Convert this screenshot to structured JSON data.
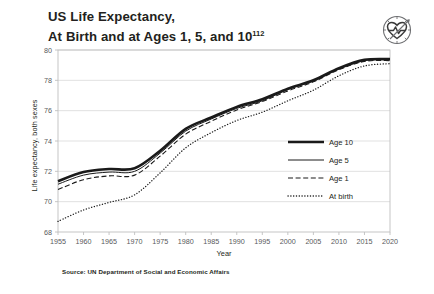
{
  "title": {
    "line1": "US Life Expectancy,",
    "line2_main": "At Birth and at Ages 1, 5, and 10",
    "line2_sup": "112"
  },
  "logo": {
    "name": "health-heart-clock-icon"
  },
  "source": {
    "text": "Source: UN Department of Social and Economic Affairs"
  },
  "chart_data": {
    "type": "line",
    "title": "US Life Expectancy, At Birth and at Ages 1, 5, and 10",
    "xlabel": "Year",
    "ylabel": "Life expectancy, both sexes",
    "xlim": [
      1955,
      2020
    ],
    "ylim": [
      68,
      80
    ],
    "xticks": [
      1955,
      1960,
      1965,
      1970,
      1975,
      1980,
      1985,
      1990,
      1995,
      2000,
      2005,
      2010,
      2015,
      2020
    ],
    "yticks": [
      68,
      70,
      72,
      74,
      76,
      78,
      80
    ],
    "grid": true,
    "legend_position": "center-right",
    "x": [
      1955,
      1960,
      1965,
      1970,
      1975,
      1980,
      1985,
      1990,
      1995,
      2000,
      2005,
      2010,
      2015,
      2020
    ],
    "series": [
      {
        "name": "Age 10",
        "style": "solid-thick",
        "values": [
          71.35,
          71.95,
          72.15,
          72.2,
          73.35,
          74.8,
          75.55,
          76.25,
          76.75,
          77.45,
          78.0,
          78.8,
          79.35,
          79.4
        ]
      },
      {
        "name": "Age 5",
        "style": "solid-thin",
        "values": [
          71.15,
          71.75,
          71.95,
          72.0,
          73.2,
          74.65,
          75.45,
          76.15,
          76.65,
          77.4,
          77.95,
          78.75,
          79.3,
          79.35
        ]
      },
      {
        "name": "Age 1",
        "style": "dashed",
        "values": [
          70.8,
          71.45,
          71.7,
          71.75,
          73.0,
          74.45,
          75.3,
          76.05,
          76.6,
          77.3,
          77.9,
          78.7,
          79.25,
          79.3
        ]
      },
      {
        "name": "At birth",
        "style": "dotted",
        "values": [
          68.7,
          69.45,
          69.95,
          70.45,
          71.9,
          73.55,
          74.55,
          75.35,
          75.9,
          76.65,
          77.35,
          78.3,
          78.95,
          79.1
        ]
      }
    ]
  },
  "legend": {
    "items": [
      {
        "label": "Age 10",
        "style": "solid-thick"
      },
      {
        "label": "Age 5",
        "style": "solid-thin"
      },
      {
        "label": "Age 1",
        "style": "dashed"
      },
      {
        "label": "At birth",
        "style": "dotted"
      }
    ]
  },
  "colors": {
    "line": "#1a1a1a",
    "grid": "#d9d9d9",
    "frame": "#bfbfbf",
    "tick_text": "#58595b",
    "text": "#231f20",
    "background": "#ffffff"
  }
}
